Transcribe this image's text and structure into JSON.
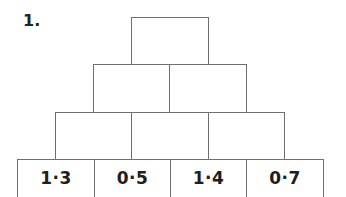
{
  "question": {
    "number_label": "1."
  },
  "pyramid": {
    "rows": [
      {
        "row": 1,
        "bricks": [
          {
            "value": ""
          }
        ]
      },
      {
        "row": 2,
        "bricks": [
          {
            "value": ""
          },
          {
            "value": ""
          }
        ]
      },
      {
        "row": 3,
        "bricks": [
          {
            "value": ""
          },
          {
            "value": ""
          },
          {
            "value": ""
          }
        ]
      },
      {
        "row": 4,
        "bricks": [
          {
            "value": "1·3"
          },
          {
            "value": "0·5"
          },
          {
            "value": "1·4"
          },
          {
            "value": "0·7"
          }
        ]
      }
    ],
    "border_color": "#6f6f6f"
  }
}
